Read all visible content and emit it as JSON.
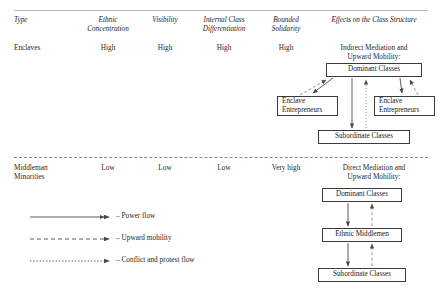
{
  "figure": {
    "type": "comparative-table-with-diagrams",
    "columns": [
      {
        "id": "type",
        "label": "Type",
        "label_line2": ""
      },
      {
        "id": "ethnic",
        "label": "Ethnic",
        "label_line2": "Concentration"
      },
      {
        "id": "visibility",
        "label": "Visibility",
        "label_line2": ""
      },
      {
        "id": "internal",
        "label": "Internal Class",
        "label_line2": "Differentiation"
      },
      {
        "id": "bounded",
        "label": "Bounded",
        "label_line2": "Solidarity"
      },
      {
        "id": "effects",
        "label": "Effects on the Class Structure",
        "label_line2": ""
      }
    ],
    "rows": [
      {
        "id": "enclaves",
        "type_label": "Enclaves",
        "type_label2": "",
        "ethnic": "High",
        "visibility": "High",
        "internal": "High",
        "bounded": "High",
        "effect_title_line1": "Indirect Mediation and",
        "effect_title_line2": "Upward Mobility:",
        "boxes": [
          {
            "id": "dominant-classes",
            "line1": "Dominant Classes",
            "line2": ""
          },
          {
            "id": "enclave-entrepreneurs-left",
            "line1": "Enclave",
            "line2": "Entrepreneurs"
          },
          {
            "id": "enclave-entrepreneurs-right",
            "line1": "Enclave",
            "line2": "Entrepreneurs"
          },
          {
            "id": "subordinate-classes",
            "line1": "Subordinate Classes",
            "line2": ""
          }
        ]
      },
      {
        "id": "middleman-minorities",
        "type_label": "Middleman",
        "type_label2": "Minorities",
        "ethnic": "Low",
        "visibility": "Low",
        "internal": "Low",
        "bounded": "Very high",
        "effect_title_line1": "Direct Mediation and",
        "effect_title_line2": "Upward Mobility:",
        "boxes": [
          {
            "id": "dominant-classes",
            "line1": "Dominant Classes",
            "line2": ""
          },
          {
            "id": "ethnic-middlemen",
            "line1": "Ethnic Middlemen",
            "line2": ""
          },
          {
            "id": "subordinate-classes",
            "line1": "Subordinate Classes",
            "line2": ""
          }
        ]
      }
    ],
    "legend": [
      {
        "id": "power-flow",
        "style": "solid",
        "label": "– Power flow"
      },
      {
        "id": "upward-mobility",
        "style": "dashed",
        "label": "– Upward mobility"
      },
      {
        "id": "conflict-protest",
        "style": "dotted",
        "label": "– Conflict and protest flow"
      }
    ],
    "colors": {
      "text": "#1a1a1a",
      "box_border": "#3b3b3b",
      "arrow": "#4a4a4a",
      "rule": "#b9b9b9",
      "divider": "#8a8a8a",
      "background": "#ffffff"
    }
  }
}
